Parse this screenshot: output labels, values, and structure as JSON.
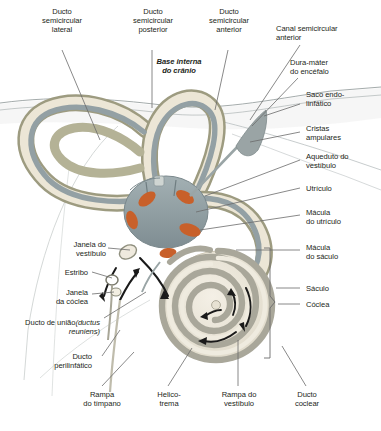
{
  "figure": {
    "title_overlay": "Base interna do crânio",
    "language": "pt-BR",
    "colors": {
      "text": "#231f20",
      "leader_line": "#6b6b6b",
      "bone_wall": "#9d9b80",
      "bone_fill": "#ece6d6",
      "membranous_duct": "#93a0a4",
      "vestibule": "#8e9ca0",
      "macula_orange": "#c8602a",
      "cochlea_band": "#a9a79a",
      "dura": "#b9bfc0",
      "arrow_black": "#1a1a1a"
    }
  },
  "labels": {
    "top": [
      {
        "id": "ducto-semicircular-lateral",
        "text": "Ducto\nsemicircular\nlateral"
      },
      {
        "id": "ducto-semicircular-posterior",
        "text": "Ducto\nsemicircular\nposterior"
      },
      {
        "id": "ducto-semicircular-anterior",
        "text": "Ducto\nsemicircular\nanterior"
      },
      {
        "id": "base-interna-do-cranio",
        "text": "Base interna\ndo crânio"
      }
    ],
    "right": [
      {
        "id": "canal-semicircular-anterior",
        "text": "Canal semicircular\nanterior"
      },
      {
        "id": "dura-mater-do-encefalo",
        "text": "Dura-máter\ndo encéfalo"
      },
      {
        "id": "saco-endolinfatico",
        "text": "Saco endo-\nlinfático"
      },
      {
        "id": "cristas-ampulares",
        "text": "Cristas\nampulares"
      },
      {
        "id": "aqueduto-do-vestibulo",
        "text": "Aqueduto do\nvestíbulo"
      },
      {
        "id": "utriculo",
        "text": "Utrículo"
      },
      {
        "id": "macula-do-utriculo",
        "text": "Mácula\ndo utrículo"
      },
      {
        "id": "macula-do-saculo",
        "text": "Mácula\ndo sáculo"
      },
      {
        "id": "saculo",
        "text": "Sáculo"
      },
      {
        "id": "coclea",
        "text": "Cóclea"
      }
    ],
    "left": [
      {
        "id": "janela-do-vestibulo",
        "text": "Janela do\nvestíbulo"
      },
      {
        "id": "estribo",
        "text": "Estribo"
      },
      {
        "id": "janela-da-coclea",
        "text": "Janela\nda cóclea"
      },
      {
        "id": "ducto-de-uniao",
        "text": "Ducto de união",
        "text_italic": "(ductus\nreuniens)"
      },
      {
        "id": "ducto-perilinfatico",
        "text": "Ducto\nperilinfático"
      }
    ],
    "bottom": [
      {
        "id": "rampa-do-timpano",
        "text": "Rampa\ndo tímpano"
      },
      {
        "id": "helicotrema",
        "text": "Helico-\ntrema"
      },
      {
        "id": "rampa-do-vestibulo",
        "text": "Rampa do\nvestíbulo"
      },
      {
        "id": "ducto-coclear",
        "text": "Ducto\ncoclear"
      }
    ]
  }
}
